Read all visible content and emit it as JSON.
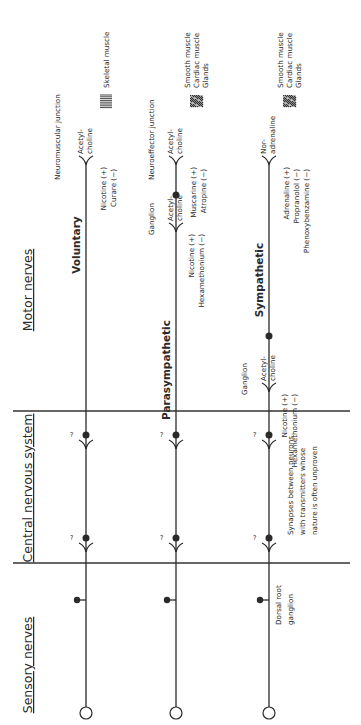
{
  "diagram": {
    "orientation": "rotated-90-ccw",
    "sections": [
      {
        "id": "motor",
        "label": "Motor nerves",
        "x": 32,
        "y": 290
      },
      {
        "id": "cns",
        "label": "Central nervous system",
        "x": 32,
        "y": 488
      },
      {
        "id": "sensory",
        "label": "Sensory nerves",
        "x": 32,
        "y": 665
      }
    ],
    "dividers": [
      411,
      563
    ],
    "pathways": [
      {
        "id": "voluntary",
        "label": "Voluntary",
        "x": 86,
        "label_pos": {
          "x": 80,
          "y": 245
        },
        "junction_label": "Neuromuscular junction",
        "junction_label_pos": {
          "x": 60,
          "y": 180
        },
        "transmitter": [
          "Acetyl-",
          "choline"
        ],
        "transmitter_fork_y": 165,
        "drugs": [
          "Nicotine  (+)",
          "Curare  (−)"
        ],
        "target_icon": "striated-muscle",
        "targets": [
          "Skeletal muscle"
        ]
      },
      {
        "id": "parasympathetic",
        "label": "Parasympathetic",
        "x": 176,
        "label_pos": {
          "x": 170,
          "y": 370
        },
        "ganglion_label": "Ganglion",
        "ganglion_fork_y": 232,
        "ganglion_transmitter": [
          "Acetyl-",
          "choline"
        ],
        "ganglion_drugs": [
          "Nicotine  (+)",
          "Hexamethonium  (−)"
        ],
        "ganglion_dot_y": 195,
        "junction_label": "Neuroeffector junction",
        "junction_label_pos": {
          "x": 154,
          "y": 180
        },
        "transmitter": [
          "Acetyl-",
          "choline"
        ],
        "transmitter_fork_y": 165,
        "drugs": [
          "Muscarine  (+)",
          "Atropine  (−)"
        ],
        "target_icon": "smooth-tissue",
        "targets": [
          "Smooth muscle",
          "Cardiac muscle",
          "Glands"
        ]
      },
      {
        "id": "sympathetic",
        "label": "Sympathetic",
        "x": 269,
        "label_pos": {
          "x": 263,
          "y": 280
        },
        "ganglion_label": "Ganglion",
        "ganglion_fork_y": 392,
        "ganglion_transmitter": [
          "Acetyl-",
          "choline"
        ],
        "ganglion_drugs": [
          "Nicotine  (+)",
          "Hexamethonium  (−)"
        ],
        "ganglion_dot_y": 336,
        "transmitter": [
          "Nor-",
          "adrenaline"
        ],
        "transmitter_fork_y": 165,
        "drugs": [
          "Adrenaline  (+)",
          "Propranolol  (−)",
          "Phenoxybenzamine  (−)"
        ],
        "target_icon": "smooth-tissue",
        "targets": [
          "Smooth muscle",
          "Cardiac muscle",
          "Glands"
        ]
      }
    ],
    "cns_synapses": {
      "y": [
        435,
        538
      ],
      "unknown_mark": "?"
    },
    "cns_note": [
      "Synapses between neurons",
      "with transmitters whose",
      "nature is often unproven"
    ],
    "sensory": {
      "ganglion_dot_y": 600,
      "receptor_y": 713,
      "ganglion_label": [
        "Dorsal root",
        "ganglion"
      ]
    },
    "colors": {
      "ink": "#2a2a2a",
      "background": "#ffffff"
    }
  }
}
